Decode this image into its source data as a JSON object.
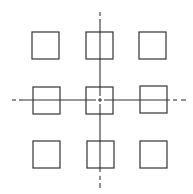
{
  "diagram": {
    "stroke_color": "#333333",
    "background": "#ffffff",
    "squares": [
      {
        "row": 0,
        "col": 0,
        "x": 32,
        "y": 32,
        "size": 27
      },
      {
        "row": 0,
        "col": 1,
        "x": 86,
        "y": 32,
        "size": 27
      },
      {
        "row": 0,
        "col": 2,
        "x": 139,
        "y": 32,
        "size": 27
      },
      {
        "row": 1,
        "col": 0,
        "x": 33,
        "y": 87,
        "size": 27
      },
      {
        "row": 1,
        "col": 1,
        "x": 86,
        "y": 87,
        "size": 27
      },
      {
        "row": 1,
        "col": 2,
        "x": 140,
        "y": 86,
        "size": 27
      },
      {
        "row": 2,
        "col": 0,
        "x": 33,
        "y": 141,
        "size": 27
      },
      {
        "row": 2,
        "col": 1,
        "x": 87,
        "y": 141,
        "size": 27
      },
      {
        "row": 2,
        "col": 2,
        "x": 140,
        "y": 141,
        "size": 27
      }
    ],
    "center_lines": {
      "horizontal": {
        "y": 100,
        "x_start": 12,
        "x_end": 186
      },
      "vertical": {
        "x": 100,
        "y_start": 12,
        "y_end": 188
      }
    }
  }
}
